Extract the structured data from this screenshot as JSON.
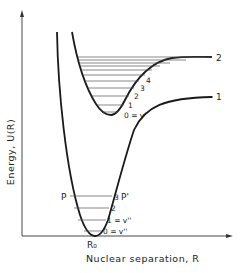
{
  "figure": {
    "y_axis_label": "Energy, U(R)",
    "x_axis_label": "Nuclear separation, R",
    "equilibrium_label": "R₀",
    "colors": {
      "ink": "#222222",
      "background": "#ffffff",
      "level_lines": "#555555"
    }
  },
  "curves": [
    {
      "id": "1",
      "label": "1",
      "role": "lower electronic state"
    },
    {
      "id": "2",
      "label": "2",
      "role": "upper electronic state"
    }
  ],
  "upper_levels": {
    "labels": [
      "0 = v'",
      "1",
      "2",
      "3",
      "4"
    ],
    "line_count": 10
  },
  "lower_levels": {
    "labels": [
      "0 = v''",
      "1 = v''",
      "2",
      "3"
    ],
    "turning_point_left": "P",
    "turning_point_right": "P'"
  }
}
